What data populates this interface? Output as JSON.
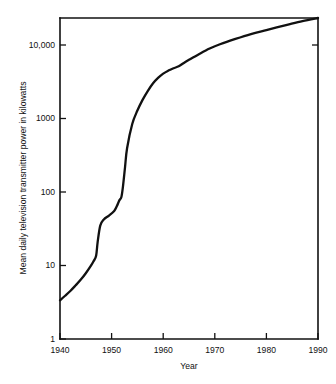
{
  "chart_data": {
    "type": "line",
    "title": "",
    "subtitle": "",
    "xlabel": "Year",
    "ylabel": "Mean daily television transmitter power in kilowatts",
    "yscale": "log",
    "xscale": "linear",
    "xlim": [
      1940,
      1990
    ],
    "ylim": [
      1,
      20000
    ],
    "grid": false,
    "legend": null,
    "xticks": [
      1940,
      1950,
      1960,
      1970,
      1980,
      1990
    ],
    "xticklabels": [
      "1940",
      "1950",
      "1960",
      "1970",
      "1980",
      "1990"
    ],
    "yticks": [
      1,
      10,
      100,
      1000,
      10000
    ],
    "yticklabels": [
      "1",
      "10",
      "100",
      "1000",
      "10,000"
    ],
    "series": [
      {
        "name": "Mean daily television transmitter power",
        "x": [
          1940,
          1941,
          1942,
          1943,
          1944,
          1945,
          1946,
          1946.5,
          1947,
          1947.3,
          1947.8,
          1948.5,
          1949.5,
          1950.5,
          1951,
          1951.5,
          1951.9,
          1952.2,
          1952.6,
          1953,
          1954,
          1955,
          1956,
          1957,
          1958,
          1959,
          1960,
          1961,
          1962,
          1963,
          1964,
          1965,
          1967,
          1969,
          1971,
          1974,
          1977,
          1980,
          1984,
          1987,
          1990
        ],
        "y": [
          3.3,
          3.8,
          4.4,
          5.2,
          6.2,
          7.6,
          9.6,
          11.0,
          13.0,
          20.0,
          33.0,
          40.0,
          45.0,
          52.0,
          60.0,
          72.0,
          80.0,
          110.0,
          200.0,
          360.0,
          760.0,
          1150.0,
          1600.0,
          2100.0,
          2650.0,
          3150.0,
          3600.0,
          3950.0,
          4250.0,
          4500.0,
          5000.0,
          5500.0,
          6600.0,
          7800.0,
          8900.0,
          10500.0,
          12200.0,
          13800.0,
          16200.0,
          18200.0,
          20000.0
        ]
      }
    ],
    "annotations": []
  },
  "colors": {
    "background": "#ffffff",
    "ink": "#111111",
    "series": "#111111"
  }
}
